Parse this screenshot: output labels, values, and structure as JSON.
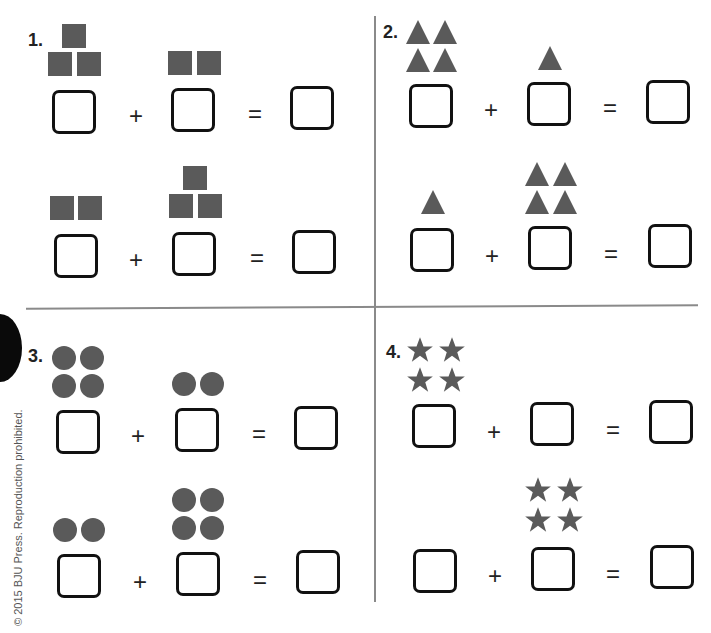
{
  "worksheet": {
    "copyright": "© 2015 BJU Press. Reproduction prohibited.",
    "problems": [
      {
        "number": "1.",
        "shape": "square",
        "rows": [
          {
            "left_count": 3,
            "right_count": 2,
            "plus": "+",
            "equals": "="
          },
          {
            "left_count": 2,
            "right_count": 3,
            "plus": "+",
            "equals": "="
          }
        ]
      },
      {
        "number": "2.",
        "shape": "triangle",
        "rows": [
          {
            "left_count": 4,
            "right_count": 1,
            "plus": "+",
            "equals": "="
          },
          {
            "left_count": 1,
            "right_count": 4,
            "plus": "+",
            "equals": "="
          }
        ]
      },
      {
        "number": "3.",
        "shape": "circle",
        "rows": [
          {
            "left_count": 4,
            "right_count": 2,
            "plus": "+",
            "equals": "="
          },
          {
            "left_count": 2,
            "right_count": 4,
            "plus": "+",
            "equals": "="
          }
        ]
      },
      {
        "number": "4.",
        "shape": "star",
        "rows": [
          {
            "left_count": 4,
            "right_count": 0,
            "plus": "+",
            "equals": "="
          },
          {
            "left_count": 0,
            "right_count": 4,
            "plus": "+",
            "equals": "="
          }
        ]
      }
    ],
    "colors": {
      "shape_fill": "#5a5a5a",
      "box_border": "#111111",
      "divider": "#8a8a8a"
    }
  }
}
